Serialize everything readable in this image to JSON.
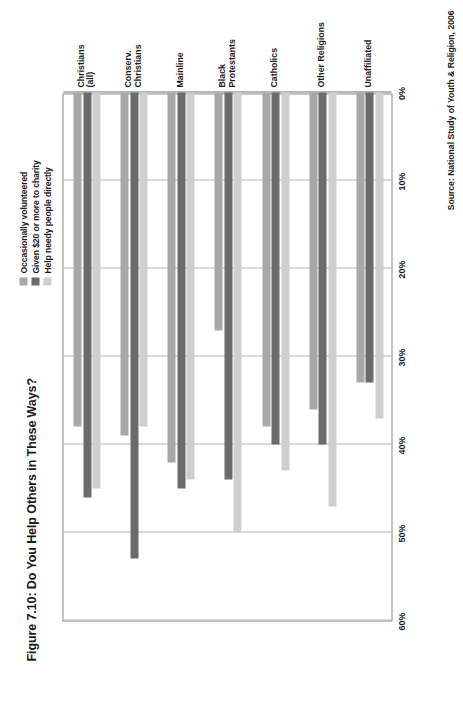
{
  "title": "Figure 7.10: Do You Help Others in These Ways?",
  "source_note": "Source: National Study of Youth & Religion, 2006",
  "legend": {
    "items": [
      {
        "label": "Occasionally volunteered",
        "color": "#a8a8a8",
        "swatch_name": "legend-swatch-volunteered"
      },
      {
        "label": "Given $20 or more to charity",
        "color": "#6b6b6b",
        "swatch_name": "legend-swatch-charity"
      },
      {
        "label": "Help needy people directly",
        "color": "#cfcfcf",
        "swatch_name": "legend-swatch-needy"
      }
    ]
  },
  "axis": {
    "tick_labels": [
      "60%",
      "50%",
      "40%",
      "30%",
      "20%",
      "10%",
      "0%"
    ],
    "tick_values": [
      60,
      50,
      40,
      30,
      20,
      10,
      0
    ],
    "min": 0,
    "max": 60
  },
  "categories": [
    "Christians\n(all)",
    "Conserv.\nChristians",
    "Mainline",
    "Black\nProtestants",
    "Catholics",
    "Other Religions",
    "Unaffiliated"
  ],
  "chart_data": {
    "type": "bar",
    "orientation": "horizontal",
    "title": "Figure 7.10: Do You Help Others in These Ways?",
    "xlabel": "",
    "ylabel": "",
    "xlim": [
      0,
      60
    ],
    "grid": true,
    "legend_position": "top-right",
    "source": "National Study of Youth & Religion, 2006",
    "categories": [
      "Christians (all)",
      "Conserv. Christians",
      "Mainline",
      "Black Protestants",
      "Catholics",
      "Other Religions",
      "Unaffiliated"
    ],
    "series": [
      {
        "name": "Occasionally volunteered",
        "color": "#a8a8a8",
        "values": [
          38,
          39,
          42,
          27,
          38,
          36,
          33
        ]
      },
      {
        "name": "Given $20 or more to charity",
        "color": "#6b6b6b",
        "values": [
          46,
          53,
          45,
          44,
          40,
          40,
          33
        ]
      },
      {
        "name": "Help needy people directly",
        "color": "#cfcfcf",
        "values": [
          45,
          38,
          44,
          50,
          43,
          47,
          37
        ]
      }
    ],
    "value_unit": "%"
  }
}
